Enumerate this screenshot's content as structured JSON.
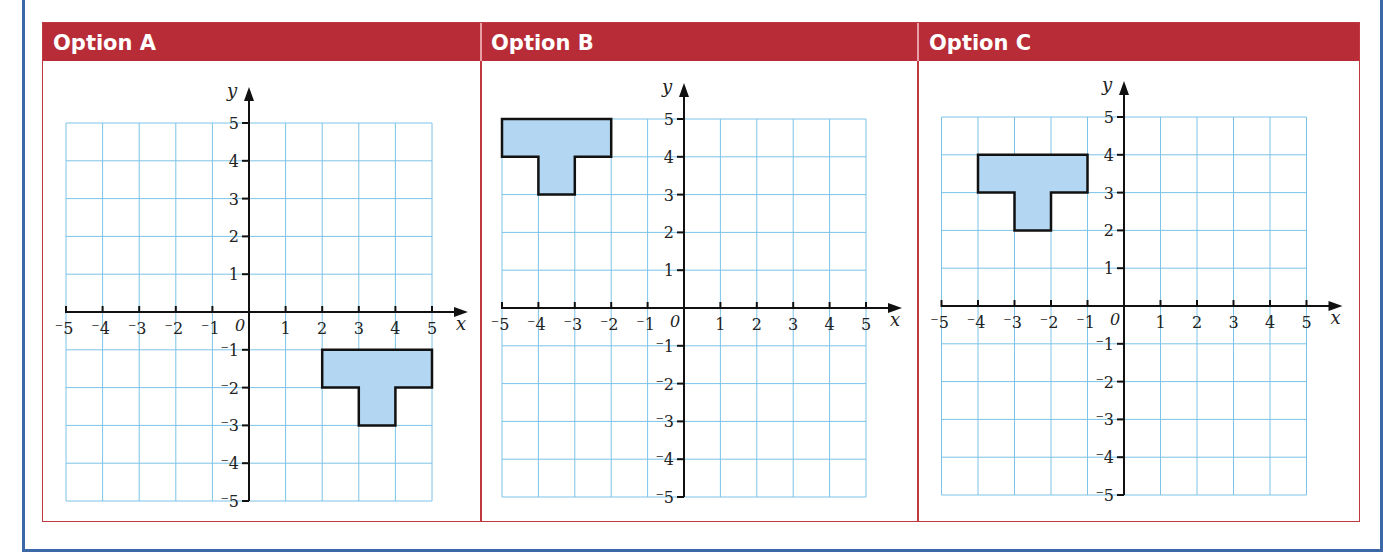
{
  "table": {
    "accent_color": "#b72c37",
    "frame_color": "#3d68a8",
    "grid_color": "#7cc3e8",
    "shape_fill": "#b3d7f2",
    "columns": [
      {
        "label": "Option A"
      },
      {
        "label": "Option B"
      },
      {
        "label": "Option C"
      }
    ]
  },
  "axes": {
    "x_label": "x",
    "y_label": "y",
    "origin_label": "0",
    "x_ticks": [
      "⁻5",
      "⁻4",
      "⁻3",
      "⁻2",
      "⁻1",
      "1",
      "2",
      "3",
      "4",
      "5"
    ],
    "y_ticks_pos": [
      "5",
      "4",
      "3",
      "2",
      "1"
    ],
    "y_ticks_neg": [
      "⁻1",
      "⁻2",
      "⁻3",
      "⁻4",
      "⁻5"
    ]
  },
  "chart_data": [
    {
      "type": "scatter",
      "title": "Option A",
      "xlabel": "x",
      "ylabel": "y",
      "xlim": [
        -5,
        5
      ],
      "ylim": [
        -5,
        5
      ],
      "grid": true,
      "shape": "T-shape",
      "polygon": [
        [
          2,
          -1
        ],
        [
          5,
          -1
        ],
        [
          5,
          -2
        ],
        [
          4,
          -2
        ],
        [
          4,
          -3
        ],
        [
          3,
          -3
        ],
        [
          3,
          -2
        ],
        [
          2,
          -2
        ]
      ]
    },
    {
      "type": "scatter",
      "title": "Option B",
      "xlabel": "x",
      "ylabel": "y",
      "xlim": [
        -5,
        5
      ],
      "ylim": [
        -5,
        5
      ],
      "grid": true,
      "shape": "T-shape",
      "polygon": [
        [
          -5,
          5
        ],
        [
          -2,
          5
        ],
        [
          -2,
          4
        ],
        [
          -3,
          4
        ],
        [
          -3,
          3
        ],
        [
          -4,
          3
        ],
        [
          -4,
          4
        ],
        [
          -5,
          4
        ]
      ]
    },
    {
      "type": "scatter",
      "title": "Option C",
      "xlabel": "x",
      "ylabel": "y",
      "xlim": [
        -5,
        5
      ],
      "ylim": [
        -5,
        5
      ],
      "grid": true,
      "shape": "T-shape",
      "polygon": [
        [
          -4,
          4
        ],
        [
          -1,
          4
        ],
        [
          -1,
          3
        ],
        [
          -2,
          3
        ],
        [
          -2,
          2
        ],
        [
          -3,
          2
        ],
        [
          -3,
          3
        ],
        [
          -4,
          3
        ]
      ]
    }
  ]
}
